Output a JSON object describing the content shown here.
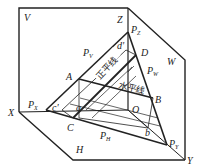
{
  "diagram": {
    "type": "descriptive-geometry plane projection",
    "projection_planes": {
      "V": "V",
      "H": "H",
      "W": "W"
    },
    "axes": {
      "X": "X",
      "Y": "Y",
      "Z": "Z",
      "origin": "O"
    },
    "traces": {
      "PV": {
        "main": "P",
        "sub": "V"
      },
      "PH": {
        "main": "P",
        "sub": "H"
      },
      "PW": {
        "main": "P",
        "sub": "W"
      },
      "PX": {
        "main": "P",
        "sub": "X"
      },
      "PY": {
        "main": "P",
        "sub": "Y"
      },
      "PZ": {
        "main": "P",
        "sub": "Z"
      }
    },
    "points": {
      "A": "A",
      "B": "B",
      "C": "C",
      "D": "D",
      "a": "a",
      "b": "b",
      "c_prime": "c'",
      "d_prime": "d'"
    },
    "line_labels": {
      "frontal_line": "正平线",
      "horizontal_line": "水平线"
    },
    "colors": {
      "stroke": "#222222",
      "background": "#ffffff"
    }
  }
}
